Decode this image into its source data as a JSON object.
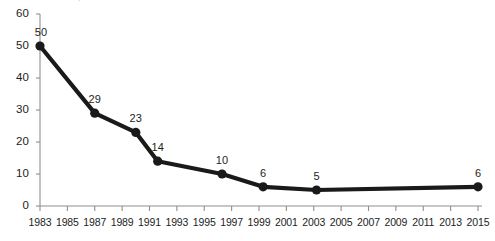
{
  "chart_data": {
    "type": "line",
    "title": "",
    "xlabel": "",
    "ylabel": "",
    "xlim": [
      1983,
      2015
    ],
    "ylim": [
      0,
      60
    ],
    "ytick_step": 10,
    "grid": false,
    "legend": "none",
    "yticks": [
      "0",
      "10",
      "20",
      "30",
      "40",
      "50",
      "60"
    ],
    "xticks": [
      "1983",
      "1985",
      "1987",
      "1989",
      "1991",
      "1993",
      "1995",
      "1997",
      "1999",
      "2001",
      "2003",
      "2005",
      "2007",
      "2009",
      "2011",
      "2013",
      "2015"
    ],
    "series": [
      {
        "name": "series-1",
        "color": "#1a1a1a",
        "points": [
          {
            "x": 1983.0,
            "y": 50,
            "label": "50"
          },
          {
            "x": 1987.0,
            "y": 29,
            "label": "29"
          },
          {
            "x": 1990.0,
            "y": 23,
            "label": "23"
          },
          {
            "x": 1991.6,
            "y": 14,
            "label": "14"
          },
          {
            "x": 1996.3,
            "y": 10,
            "label": "10"
          },
          {
            "x": 1999.3,
            "y": 6,
            "label": "6"
          },
          {
            "x": 2003.2,
            "y": 5,
            "label": "5"
          },
          {
            "x": 2015.0,
            "y": 6,
            "label": "6"
          }
        ]
      }
    ],
    "x": [
      1983,
      1987,
      1990,
      1991.6,
      1996.3,
      1999.3,
      2003.2,
      2015
    ],
    "values": [
      50,
      29,
      23,
      14,
      10,
      6,
      5,
      6
    ]
  },
  "artifacts": {
    "top_cropped_text": "."
  }
}
